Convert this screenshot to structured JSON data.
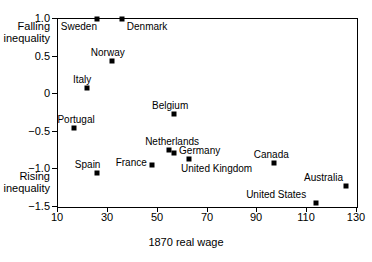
{
  "chart_data": {
    "type": "scatter",
    "title": "",
    "xlabel": "1870 real wage",
    "ylabel": "",
    "xlim": [
      10,
      130
    ],
    "ylim": [
      -1.5,
      1.0
    ],
    "xticks": [
      10,
      30,
      50,
      70,
      90,
      110,
      130
    ],
    "xtick_labels": [
      "10",
      "30",
      "50",
      "70",
      "90",
      "110",
      "130"
    ],
    "yticks": [
      1.0,
      0.5,
      0,
      -0.5,
      -1.0,
      -1.5
    ],
    "ytick_labels": [
      "1.0",
      "0.5",
      "0",
      "−0.5",
      "−1.0",
      "−1.5"
    ],
    "grid": false,
    "legend": null,
    "annotations": [
      {
        "text": "Falling\ninequality",
        "line1": "Falling",
        "line2": "inequality",
        "near_y": 0.82
      },
      {
        "text": "Rising\ninequality",
        "line1": "Rising",
        "line2": "inequality",
        "near_y": -1.18
      }
    ],
    "points": [
      {
        "label": "Sweden",
        "x": 26,
        "y": 0.99,
        "label_dx": -36,
        "label_dy": 8
      },
      {
        "label": "Denmark",
        "x": 36,
        "y": 0.99,
        "label_dx": 5,
        "label_dy": 8
      },
      {
        "label": "Norway",
        "x": 32,
        "y": 0.43,
        "label_dx": -21,
        "label_dy": -8
      },
      {
        "label": "Italy",
        "x": 22,
        "y": 0.07,
        "label_dx": -14,
        "label_dy": -8
      },
      {
        "label": "Belgium",
        "x": 57,
        "y": -0.28,
        "label_dx": -22,
        "label_dy": -8
      },
      {
        "label": "Portugal",
        "x": 17,
        "y": -0.46,
        "label_dx": -17,
        "label_dy": -8
      },
      {
        "label": "Netherlands",
        "x": 55,
        "y": -0.76,
        "label_dx": -24,
        "label_dy": -8
      },
      {
        "label": "Germany",
        "x": 57,
        "y": -0.8,
        "label_dx": 5,
        "label_dy": -2
      },
      {
        "label": "France",
        "x": 48,
        "y": -0.95,
        "label_dx": -36,
        "label_dy": -2
      },
      {
        "label": "United Kingdom",
        "x": 63,
        "y": -0.87,
        "label_dx": -8,
        "label_dy": 10
      },
      {
        "label": "Spain",
        "x": 26,
        "y": -1.06,
        "label_dx": -22,
        "label_dy": -8
      },
      {
        "label": "Canada",
        "x": 97,
        "y": -0.93,
        "label_dx": -20,
        "label_dy": -8
      },
      {
        "label": "Australia",
        "x": 126,
        "y": -1.24,
        "label_dx": -42,
        "label_dy": -8
      },
      {
        "label": "United States",
        "x": 114,
        "y": -1.46,
        "label_dx": -70,
        "label_dy": -8
      }
    ]
  }
}
